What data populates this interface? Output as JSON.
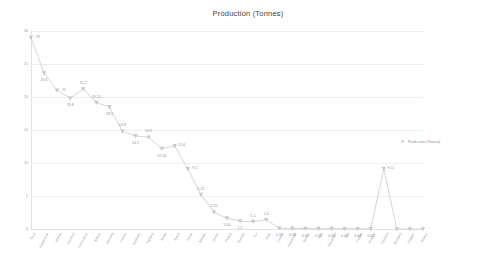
{
  "chart_data": {
    "type": "line",
    "title": "Production (Tonnes)",
    "xlabel": "",
    "ylabel": "",
    "ylim": [
      0,
      30
    ],
    "yticks": [
      0,
      5,
      10,
      15,
      20,
      25,
      30
    ],
    "ytick_labels": [
      "0",
      "5",
      "10",
      "15",
      "20",
      "25",
      "30"
    ],
    "grid": true,
    "legend_position": "right",
    "legend": [
      "Production (Tonnes)"
    ],
    "marker": "triangle-down",
    "line_color": "#d0d0d0",
    "marker_color": "#c8c8c8",
    "label_color": "#8c8c8c",
    "categories": [
      "Rice",
      "Sugarcane",
      "Wheat",
      "Coconut",
      "Groundnut",
      "Maize",
      "Banana",
      "Cotton",
      "Soybean",
      "Tapioca",
      "Jowar",
      "Bajra",
      "Gram",
      "Mango",
      "Onion",
      "Potato",
      "Tomato",
      "Tur",
      "Ragi",
      "Castor",
      "Sunflower",
      "Barley",
      "Jute",
      "Sesamum",
      "Tea",
      "Coffee",
      "Rubber",
      "Cashew",
      "Mustard",
      "Pepper",
      "Others"
    ],
    "values": [
      29,
      23.6,
      21,
      19.8,
      21.2,
      19.15,
      18.5,
      14.8,
      14.1,
      13.9,
      12.16,
      12.6,
      9.1,
      5.22,
      2.55,
      1.64,
      1.2,
      1.1,
      1.4,
      0.11,
      0.08,
      0.07,
      0.05,
      0.04,
      0.03,
      0.03,
      0.02,
      9.11,
      0,
      0,
      0
    ],
    "point_labels": [
      "29",
      "23.6",
      "21",
      "19.8",
      "21.2",
      "19.15",
      "18.5",
      "14.8",
      "14.1",
      "13.9",
      "12.16",
      "12.6",
      "9.1",
      "5.22",
      "2.55",
      "1.64",
      "1.2",
      "1.1",
      "1.4",
      "0.11",
      "0.08",
      "0.07",
      "0.05",
      "0.04",
      "0.03",
      "0.03",
      "0.02",
      "9.11",
      "",
      "",
      ""
    ],
    "series": [
      {
        "name": "Production (Tonnes)",
        "values": [
          29,
          23.6,
          21,
          19.8,
          21.2,
          19.15,
          18.5,
          14.8,
          14.1,
          13.9,
          12.16,
          12.6,
          9.1,
          5.22,
          2.55,
          1.64,
          1.2,
          1.1,
          1.4,
          0.11,
          0.08,
          0.07,
          0.05,
          0.04,
          0.03,
          0.03,
          0.02,
          9.11,
          0,
          0,
          0
        ]
      }
    ]
  }
}
